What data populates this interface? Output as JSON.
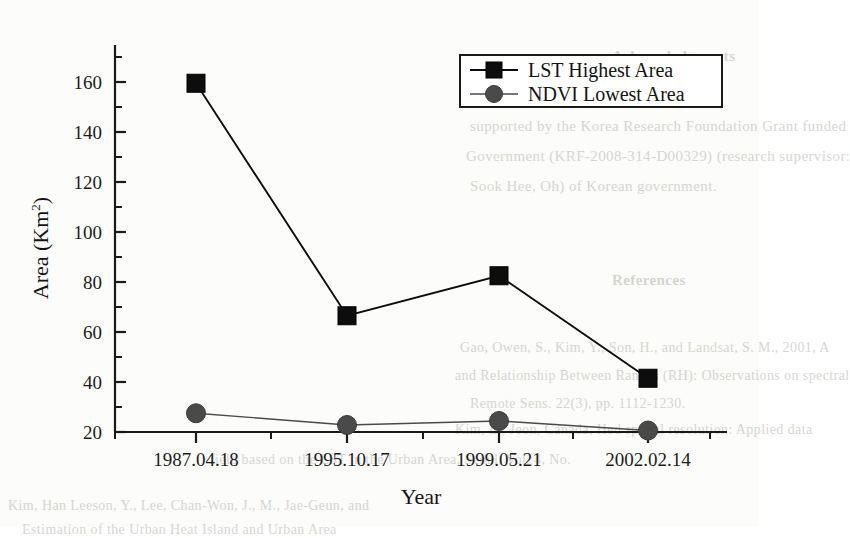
{
  "chart_data": {
    "type": "line",
    "title": "",
    "xlabel": "Year",
    "ylabel": "Area (Km2)",
    "ylabel_base": "Area (Km",
    "ylabel_sup": "2",
    "ylabel_close": ")",
    "categories": [
      "1987.04.18",
      "1995.10.17",
      "1999.05.21",
      "2002.02.14"
    ],
    "series": [
      {
        "name": "LST Highest Area",
        "marker": "square",
        "color": "#0d0d0d",
        "values": [
          159.5,
          66.5,
          82.5,
          41.5
        ]
      },
      {
        "name": "NDVI Lowest Area",
        "marker": "circle",
        "color": "#4a4a4a",
        "values": [
          27.5,
          22.8,
          24.4,
          20.6
        ]
      }
    ],
    "ylim": [
      20,
      170
    ],
    "yticks": [
      20,
      40,
      60,
      80,
      100,
      120,
      140,
      160
    ],
    "ytick_labels": [
      "20",
      "40",
      "60",
      "80",
      "100",
      "120",
      "140",
      "160"
    ],
    "minor_ticks": true,
    "grid": false,
    "legend_position": "top-right"
  },
  "legend": {
    "entries": [
      {
        "label": "LST Highest Area",
        "marker": "square-marker-icon"
      },
      {
        "label": "NDVI Lowest Area",
        "marker": "circle-marker-icon"
      }
    ]
  },
  "background_text": {
    "lines": [
      {
        "text": "Acknowledgments",
        "x": 612,
        "y": 48,
        "size": 15,
        "weight": "bold"
      },
      {
        "text": "supported by the Korea Research Foundation Grant funded",
        "x": 470,
        "y": 118,
        "size": 15
      },
      {
        "text": "Government (KRF-2008-314-D00329) (research supervisor:",
        "x": 466,
        "y": 148,
        "size": 15
      },
      {
        "text": "Sook Hee, Oh) of Korean government.",
        "x": 470,
        "y": 178,
        "size": 15
      },
      {
        "text": "References",
        "x": 612,
        "y": 272,
        "size": 15,
        "weight": "bold"
      },
      {
        "text": "Gao, Owen, S., Kim, Y., Son, H., and Landsat, S. M., 2001, A",
        "x": 460,
        "y": 340,
        "size": 14
      },
      {
        "text": "and Relationship Between Ranges (RH): Observations on spectral",
        "x": 455,
        "y": 368,
        "size": 14
      },
      {
        "text": "Remote Sens. 22(3), pp. 1112-1230.",
        "x": 470,
        "y": 396,
        "size": 14
      },
      {
        "text": "Kim, L., Jeon, Canada, Hed spatial resolution: Applied data",
        "x": 455,
        "y": 422,
        "size": 14
      },
      {
        "text": "field based on the LST in the Urban Area, Seoul, Vol. 4, No.",
        "x": 210,
        "y": 452,
        "size": 14
      },
      {
        "text": "Kim, Han Leeson, Y., Lee, Chan-Won, J., M., Jae-Geun, and",
        "x": 8,
        "y": 498,
        "size": 14
      },
      {
        "text": "Estimation of the Urban Heat Island and Urban Area",
        "x": 22,
        "y": 522,
        "size": 14
      }
    ]
  }
}
